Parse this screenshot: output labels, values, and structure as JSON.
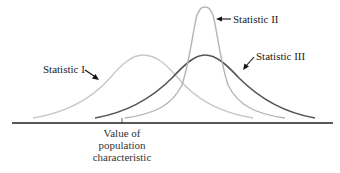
{
  "diagram": {
    "type": "sampling-distributions",
    "curves": [
      {
        "name": "Statistic I",
        "color": "#c8c8c8",
        "center_x": 143,
        "peak_y": 55,
        "description": "biased, moderate spread"
      },
      {
        "name": "Statistic II",
        "color": "#b4b4b4",
        "center_x": 205,
        "peak_y": 7,
        "description": "biased, small spread"
      },
      {
        "name": "Statistic III",
        "color": "#555555",
        "center_x": 205,
        "peak_y": 55,
        "description": "biased, larger spread"
      }
    ],
    "labels": {
      "stat1": "Statistic I",
      "stat2": "Statistic II",
      "stat3": "Statistic III",
      "marker_line1": "Value of",
      "marker_line2": "population",
      "marker_line3": "characteristic"
    },
    "axis_color": "#222222"
  }
}
